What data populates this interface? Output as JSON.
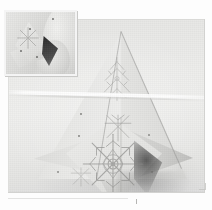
{
  "figure": {
    "background_color": "#fdfdfd",
    "photo_background_color": "#eaeae8",
    "paper_color": "#e8e8e6",
    "shadow_color": "#2a2a2a",
    "accent_color": "#b9b9b7"
  },
  "main_photo": {
    "name": "main-photograph",
    "subject": "Folded snowflake paper model",
    "surface_tone": "#eaeae8",
    "light_streak": "horizontal light reflection across the upper third"
  },
  "model": {
    "name": "folded-paper-model",
    "facets": [
      {
        "id": "left-tall",
        "label": "Upper left tall facet",
        "tone": "#e9e9e7"
      },
      {
        "id": "right-tall",
        "label": "Upper right tall facet",
        "tone": "#dedede"
      },
      {
        "id": "lower-left",
        "label": "Lower left wing",
        "tone": "#e6e6e4"
      },
      {
        "id": "lower-right",
        "label": "Lower right wing",
        "tone": "#cdcdcb"
      },
      {
        "id": "diamond",
        "label": "Central kite facet",
        "tone": "#e7e7e5"
      },
      {
        "id": "bottom-tuck",
        "label": "Bottom tuck flap",
        "tone": "#d8d8d6"
      }
    ],
    "ornaments": [
      {
        "id": "flake-top",
        "label": "Upper snowflake motif"
      },
      {
        "id": "flake-mid",
        "label": "Middle star motif"
      },
      {
        "id": "flake-main",
        "label": "Large central snowflake motif"
      },
      {
        "id": "flake-lower",
        "label": "Lower left snowflake sprig"
      }
    ]
  },
  "inset_photo": {
    "name": "inset-photograph",
    "subject": "Hands folding the paper model",
    "position": "top-left",
    "border_color": "#f4f4f4"
  }
}
